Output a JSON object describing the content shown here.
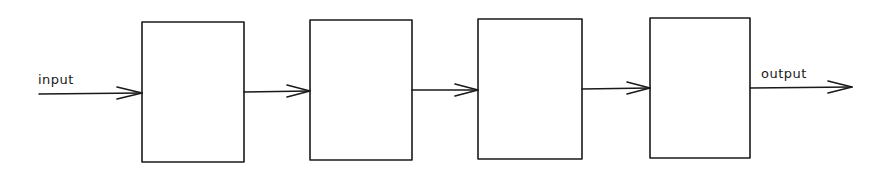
{
  "diagram": {
    "type": "block-chain",
    "labels": {
      "input": "input",
      "output": "output"
    },
    "colors": {
      "stroke": "#1a1a1a",
      "background": "#ffffff"
    },
    "blocks": [
      {
        "id": "block-1",
        "label": ""
      },
      {
        "id": "block-2",
        "label": ""
      },
      {
        "id": "block-3",
        "label": ""
      },
      {
        "id": "block-4",
        "label": ""
      }
    ],
    "connections": [
      {
        "from": "input",
        "to": "block-1"
      },
      {
        "from": "block-1",
        "to": "block-2"
      },
      {
        "from": "block-2",
        "to": "block-3"
      },
      {
        "from": "block-3",
        "to": "block-4"
      },
      {
        "from": "block-4",
        "to": "output"
      }
    ]
  }
}
